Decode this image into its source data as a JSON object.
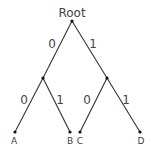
{
  "diagram": {
    "type": "binary-tree",
    "colors": {
      "edge": "#333333",
      "node": "#111111",
      "text": "#444444",
      "background": "#ffffff"
    },
    "root": {
      "label": "Root",
      "x": 72,
      "y": 21,
      "label_x": 72,
      "label_y": 17
    },
    "internal_nodes": [
      {
        "id": "left",
        "x": 43,
        "y": 78
      },
      {
        "id": "right",
        "x": 107,
        "y": 78
      }
    ],
    "leaves": [
      {
        "id": "A",
        "label": "A",
        "x": 15,
        "y": 132,
        "label_x": 14,
        "label_y": 144
      },
      {
        "id": "B",
        "label": "B",
        "x": 70,
        "y": 132,
        "label_x": 70,
        "label_y": 144
      },
      {
        "id": "C",
        "label": "C",
        "x": 80,
        "y": 132,
        "label_x": 80,
        "label_y": 144
      },
      {
        "id": "D",
        "label": "D",
        "x": 140,
        "y": 132,
        "label_x": 141,
        "label_y": 144
      }
    ],
    "edges": [
      {
        "from": "root",
        "to": "left",
        "label": "0",
        "label_x": 52,
        "label_y": 48
      },
      {
        "from": "root",
        "to": "right",
        "label": "1",
        "label_x": 93,
        "label_y": 48
      },
      {
        "from": "left",
        "to": "A",
        "label": "0",
        "label_x": 24,
        "label_y": 104
      },
      {
        "from": "left",
        "to": "B",
        "label": "1",
        "label_x": 60,
        "label_y": 104
      },
      {
        "from": "right",
        "to": "C",
        "label": "0",
        "label_x": 87,
        "label_y": 104
      },
      {
        "from": "right",
        "to": "D",
        "label": "1",
        "label_x": 126,
        "label_y": 104
      }
    ]
  }
}
